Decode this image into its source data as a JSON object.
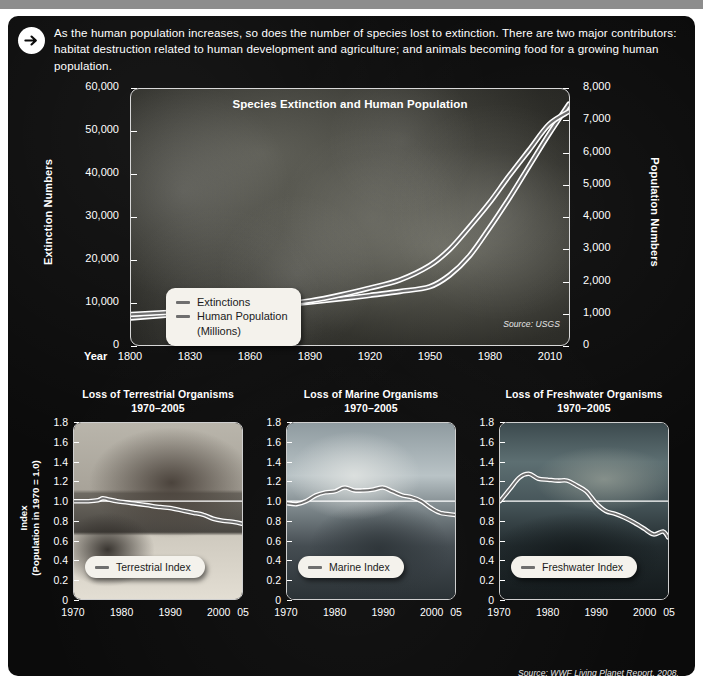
{
  "intro": {
    "arrow_icon": "arrow-right-circle-icon",
    "text": "As the human population increases, so does the number of species lost to extinction. There are two major contributors: habitat destruction related to human development and agriculture; and animals becoming food for a growing human population."
  },
  "colors": {
    "background": "#ffffff",
    "poster": "#0b0b0b",
    "text": "#ffffff",
    "line_stroke": "#ffffff",
    "line_core": "#6f6f6f",
    "legend_bg": "#f4f2ec",
    "legend_text": "#1b1b1b",
    "topbar": "#8d8d8d"
  },
  "main_chart": {
    "title": "Species Extinction and Human Population",
    "source": "Source: USGS",
    "x_axis_word": "Year",
    "y_left_label": "Extinction Numbers",
    "y_right_label": "Population Numbers",
    "y_left_ticks": [
      "0",
      "10,000",
      "20,000",
      "30,000",
      "40,000",
      "50,000",
      "60,000"
    ],
    "y_right_ticks": [
      "0",
      "1,000",
      "2,000",
      "3,000",
      "4,000",
      "5,000",
      "6,000",
      "7,000",
      "8,000"
    ],
    "x_ticks": [
      "1800",
      "1830",
      "1860",
      "1890",
      "1920",
      "1950",
      "1980",
      "2010"
    ],
    "legend": [
      {
        "label": "Extinctions",
        "swatch": "line-swatch"
      },
      {
        "label": "Human Population\n(Millions)",
        "swatch": "line-swatch"
      }
    ]
  },
  "panels": [
    {
      "id": "terrestrial",
      "title": "Loss of Terrestrial Organisms\n1970–2005",
      "legend_label": "Terrestrial Index",
      "photo_alt": "hippopotamus-photo",
      "y_label_line1": "Index",
      "y_label_line2": "(Population in 1970 = 1.0)",
      "y_ticks": [
        "0",
        "0.2",
        "0.4",
        "0.6",
        "0.8",
        "1.0",
        "1.2",
        "1.4",
        "1.6",
        "1.8"
      ],
      "x_ticks": [
        "1970",
        "1980",
        "1990",
        "2000",
        "05"
      ]
    },
    {
      "id": "marine",
      "title": "Loss of Marine Organisms\n1970–2005",
      "legend_label": "Marine Index",
      "photo_alt": "sea-turtle-photo",
      "y_ticks": [
        "0",
        "0.2",
        "0.4",
        "0.6",
        "0.8",
        "1.0",
        "1.2",
        "1.4",
        "1.6",
        "1.8"
      ],
      "x_ticks": [
        "1970",
        "1980",
        "1990",
        "2000",
        "05"
      ]
    },
    {
      "id": "freshwater",
      "title": "Loss of Freshwater Organisms\n1970–2005",
      "legend_label": "Freshwater Index",
      "photo_alt": "trout-photo",
      "y_ticks": [
        "0",
        "0.2",
        "0.4",
        "0.6",
        "0.8",
        "1.0",
        "1.2",
        "1.4",
        "1.6",
        "1.8"
      ],
      "x_ticks": [
        "1970",
        "1980",
        "1990",
        "2000",
        "05"
      ]
    }
  ],
  "bottom_source": "Source: WWF Living Planet Report, 2008.",
  "chart_data": [
    {
      "type": "line",
      "title": "Species Extinction and Human Population",
      "xlabel": "Year",
      "ylabel": "Extinction Numbers",
      "y2label": "Population Numbers",
      "xlim": [
        1800,
        2020
      ],
      "ylim": [
        0,
        60000
      ],
      "y2lim": [
        0,
        8000
      ],
      "grid": false,
      "legend_position": "inside-left",
      "annotations": [
        "Source: USGS"
      ],
      "series": [
        {
          "name": "Extinctions",
          "axis": "left",
          "x": [
            1800,
            1830,
            1860,
            1890,
            1910,
            1920,
            1935,
            1950,
            1960,
            1970,
            1980,
            1990,
            2000,
            2010,
            2020
          ],
          "values": [
            6500,
            7600,
            8800,
            10200,
            11200,
            11800,
            12700,
            13800,
            16500,
            21000,
            27500,
            34500,
            42000,
            49500,
            56500
          ]
        },
        {
          "name": "Human Population (Millions)",
          "axis": "right",
          "x": [
            1800,
            1830,
            1860,
            1890,
            1910,
            1920,
            1935,
            1950,
            1960,
            1970,
            1980,
            1990,
            2000,
            2010,
            2020
          ],
          "values": [
            980,
            1080,
            1200,
            1400,
            1650,
            1800,
            2050,
            2500,
            3000,
            3700,
            4450,
            5300,
            6100,
            6900,
            7300
          ]
        }
      ]
    },
    {
      "type": "line",
      "title": "Loss of Terrestrial Organisms 1970–2005",
      "xlabel": "",
      "ylabel": "Index (Population in 1970 = 1.0)",
      "xlim": [
        1970,
        2005
      ],
      "ylim": [
        0,
        1.8
      ],
      "grid": false,
      "reference_line": 1.0,
      "series": [
        {
          "name": "Terrestrial Index",
          "x": [
            1970,
            1973,
            1975,
            1976,
            1977,
            1979,
            1982,
            1985,
            1988,
            1990,
            1993,
            1995,
            1997,
            1999,
            2001,
            2003,
            2005
          ],
          "values": [
            1.0,
            1.0,
            1.01,
            1.03,
            1.02,
            1.0,
            0.98,
            0.96,
            0.94,
            0.93,
            0.9,
            0.88,
            0.86,
            0.82,
            0.8,
            0.79,
            0.77
          ]
        }
      ]
    },
    {
      "type": "line",
      "title": "Loss of Marine Organisms 1970–2005",
      "xlabel": "",
      "ylabel": "Index (Population in 1970 = 1.0)",
      "xlim": [
        1970,
        2005
      ],
      "ylim": [
        0,
        1.8
      ],
      "grid": false,
      "reference_line": 1.0,
      "series": [
        {
          "name": "Marine Index",
          "x": [
            1970,
            1972,
            1974,
            1976,
            1978,
            1980,
            1982,
            1984,
            1986,
            1988,
            1990,
            1992,
            1994,
            1996,
            1998,
            2000,
            2002,
            2005
          ],
          "values": [
            0.98,
            0.97,
            1.0,
            1.06,
            1.09,
            1.1,
            1.14,
            1.11,
            1.11,
            1.12,
            1.14,
            1.1,
            1.06,
            1.04,
            1.0,
            0.93,
            0.88,
            0.86
          ]
        }
      ]
    },
    {
      "type": "line",
      "title": "Loss of Freshwater Organisms 1970–2005",
      "xlabel": "",
      "ylabel": "Index (Population in 1970 = 1.0)",
      "xlim": [
        1970,
        2005
      ],
      "ylim": [
        0,
        1.8
      ],
      "grid": false,
      "reference_line": 1.0,
      "series": [
        {
          "name": "Freshwater Index",
          "x": [
            1970,
            1972,
            1974,
            1976,
            1978,
            1980,
            1982,
            1984,
            1986,
            1988,
            1990,
            1992,
            1994,
            1996,
            1998,
            2000,
            2002,
            2004,
            2005
          ],
          "values": [
            1.0,
            1.12,
            1.24,
            1.28,
            1.23,
            1.22,
            1.21,
            1.21,
            1.16,
            1.1,
            0.98,
            0.9,
            0.87,
            0.83,
            0.78,
            0.72,
            0.66,
            0.69,
            0.63
          ]
        }
      ]
    }
  ]
}
